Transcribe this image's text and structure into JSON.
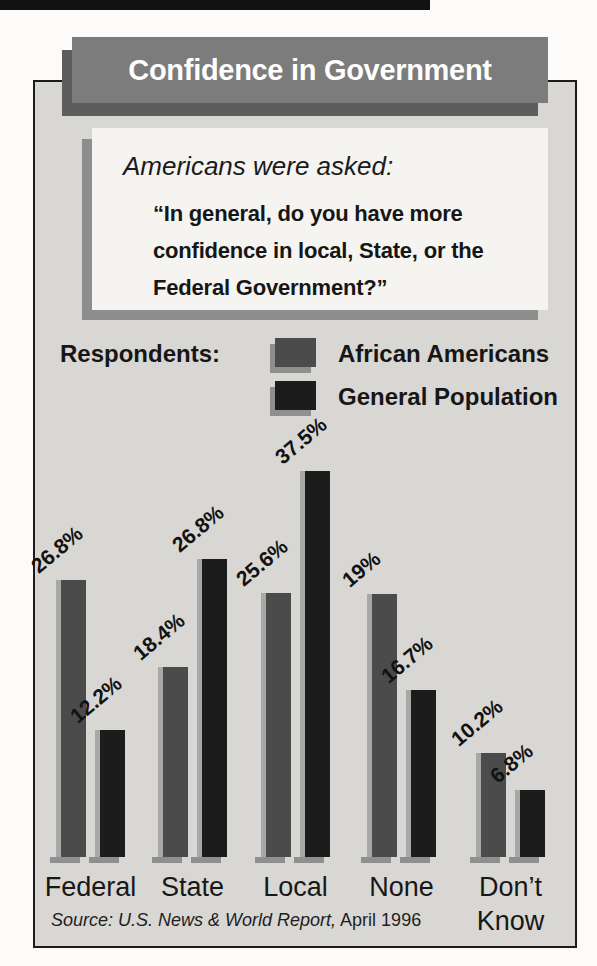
{
  "title": "Confidence in Government",
  "question": {
    "intro": "Americans were asked:",
    "quote": "“In general, do you have more\nconfidence in local, State, or the\nFederal Government?”"
  },
  "legend": {
    "label": "Respondents:",
    "series": [
      {
        "name": "African Americans",
        "color": "#4b4b4b"
      },
      {
        "name": "General Population",
        "color": "#1c1c1c"
      }
    ]
  },
  "chart_data": {
    "type": "bar",
    "title": "Confidence in Government",
    "categories": [
      "Federal",
      "State",
      "Local",
      "None",
      "Don’t Know"
    ],
    "series": [
      {
        "name": "African Americans",
        "values": [
          26.8,
          18.4,
          25.6,
          19,
          10.2
        ],
        "labels": [
          "26.8%",
          "18.4%",
          "25.6%",
          "19%",
          "10.2%"
        ],
        "color": "#4b4b4b",
        "bar_heights_px": [
          277,
          190,
          264,
          263,
          104
        ]
      },
      {
        "name": "General Population",
        "values": [
          12.2,
          26.8,
          37.5,
          16.7,
          6.8
        ],
        "labels": [
          "12.2%",
          "26.8%",
          "37.5%",
          "16.7%",
          "6.8%"
        ],
        "color": "#1c1c1c",
        "bar_heights_px": [
          127,
          298,
          386,
          167,
          67
        ]
      }
    ],
    "xlabel": "",
    "ylabel": "",
    "ylim": [
      0,
      40
    ],
    "grid": false,
    "legend_position": "top",
    "value_labels_rotated_deg": -40,
    "layout": {
      "group_lefts_px": [
        56,
        158,
        261,
        367,
        476
      ],
      "bar_width_px": 30,
      "pair_gap_px": 9,
      "highlight_color": "#a8a8a8",
      "shadow_color": "#8f8f8f"
    }
  },
  "source": {
    "citation_italic": "Source: U.S. News & World Report,",
    "date": " April 1996"
  },
  "colors": {
    "panel_bg": "#d8d7d4",
    "titlebar_bg": "#7c7c7c",
    "titlebar_shadow": "#5d5d5d",
    "question_box_bg": "#f5f4f1",
    "question_box_shadow": "#8d8d8d",
    "page_bg": "#fcfbfa"
  }
}
